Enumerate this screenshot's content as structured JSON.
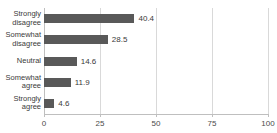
{
  "chart_data": {
    "type": "bar",
    "orientation": "horizontal",
    "title": "",
    "xlabel": "",
    "ylabel": "",
    "categories": [
      "Strongly disagree",
      "Somewhat disagree",
      "Neutral",
      "Somewhat agree",
      "Strongly agree"
    ],
    "values": [
      40.4,
      28.5,
      14.6,
      11.9,
      4.6
    ],
    "value_labels": [
      "40.4",
      "28.5",
      "14.6",
      "11.9",
      "4.6"
    ],
    "xlim": [
      0,
      100
    ],
    "xticks": [
      0,
      25,
      50,
      75,
      100
    ],
    "xtick_labels": [
      "0",
      "25",
      "50",
      "75",
      "100"
    ],
    "grid": true,
    "legend": null,
    "bar_color": "#595959",
    "grid_color": "#D9D9D9",
    "axis_color": "#BFBFBF",
    "text_color": "#3A3A3A"
  },
  "title_sliver": {
    "text": ""
  }
}
